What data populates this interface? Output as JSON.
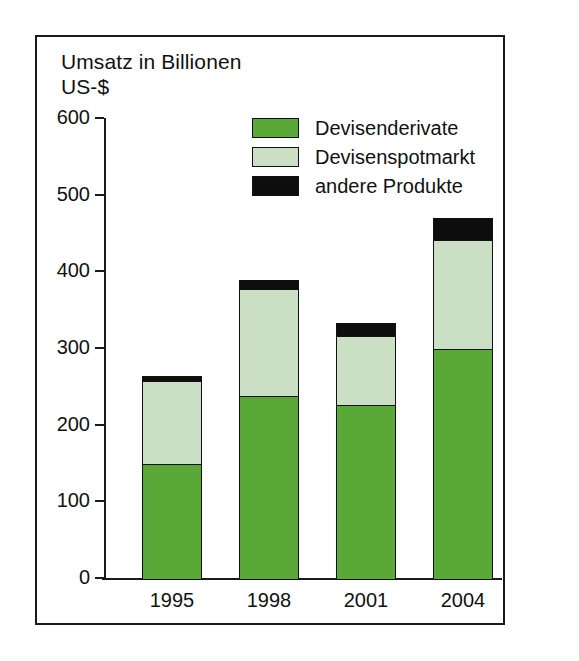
{
  "chart_data": {
    "type": "bar",
    "stacked": true,
    "title": "Umsatz in Billionen US-$",
    "title_lines": "Umsatz in Billionen\nUS-$",
    "xlabel": "",
    "ylabel": "Umsatz in Billionen US-$",
    "categories": [
      "1995",
      "1998",
      "2001",
      "2004"
    ],
    "ylim": [
      0,
      600
    ],
    "yticks": [
      0,
      100,
      200,
      300,
      400,
      500,
      600
    ],
    "ytick_labels": [
      "0",
      "100",
      "200",
      "300",
      "400",
      "500",
      "600"
    ],
    "grid": false,
    "legend_position": "upper center inside",
    "series": [
      {
        "name": "Devisenderivate",
        "color": "#59a838",
        "values": [
          151,
          239,
          228,
          301
        ]
      },
      {
        "name": "Devisenspotmarkt",
        "color": "#cbdfc4",
        "values": [
          110,
          142,
          91,
          144
        ]
      },
      {
        "name": "andere Produkte",
        "color": "#0d0d0d",
        "values": [
          9,
          13,
          20,
          30
        ]
      }
    ],
    "totals": [
      270,
      394,
      339,
      475
    ]
  },
  "legend": {
    "items": [
      {
        "label": "Devisenderivate",
        "swatch": "derivate"
      },
      {
        "label": "Devisenspotmarkt",
        "swatch": "spot"
      },
      {
        "label": "andere Produkte",
        "swatch": "andere"
      }
    ]
  },
  "colors": {
    "derivate": "#59a838",
    "spot": "#cbdfc4",
    "andere": "#0d0d0d",
    "outline": "#111111",
    "frame": "#1a1a1a",
    "background": "#ffffff"
  }
}
